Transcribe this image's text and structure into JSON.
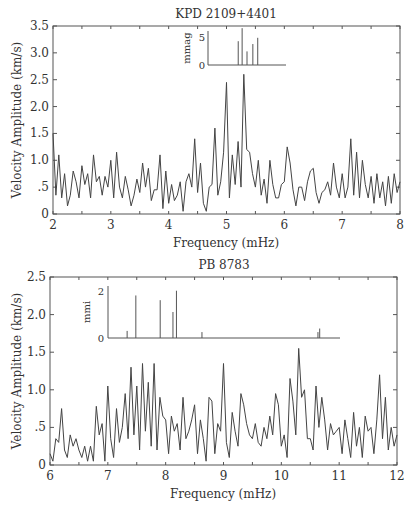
{
  "chart_data": [
    {
      "type": "line",
      "title": "KPD 2109+4401",
      "xlabel": "Frequency (mHz)",
      "ylabel": "Velocity Amplitude (km/s)",
      "xlim": [
        2,
        8
      ],
      "ylim": [
        0,
        3.5
      ],
      "x_ticks": [
        "2",
        "3",
        "4",
        "5",
        "6",
        "7",
        "8"
      ],
      "y_ticks": [
        "0",
        ".5",
        "1.0",
        "1.5",
        "2.0",
        "2.5",
        "3.0",
        "3.5"
      ],
      "grid": false,
      "x": [
        2.0,
        2.05,
        2.1,
        2.15,
        2.2,
        2.25,
        2.3,
        2.35,
        2.4,
        2.45,
        2.5,
        2.55,
        2.6,
        2.65,
        2.7,
        2.75,
        2.8,
        2.85,
        2.9,
        2.95,
        3.0,
        3.05,
        3.1,
        3.15,
        3.2,
        3.25,
        3.3,
        3.35,
        3.4,
        3.45,
        3.5,
        3.55,
        3.6,
        3.65,
        3.7,
        3.75,
        3.8,
        3.85,
        3.9,
        3.95,
        4.0,
        4.05,
        4.1,
        4.15,
        4.2,
        4.25,
        4.3,
        4.35,
        4.4,
        4.45,
        4.5,
        4.55,
        4.6,
        4.65,
        4.7,
        4.75,
        4.8,
        4.85,
        4.9,
        4.95,
        5.0,
        5.05,
        5.1,
        5.15,
        5.2,
        5.25,
        5.3,
        5.35,
        5.4,
        5.45,
        5.5,
        5.55,
        5.6,
        5.65,
        5.7,
        5.75,
        5.8,
        5.85,
        5.9,
        5.95,
        6.0,
        6.05,
        6.1,
        6.15,
        6.2,
        6.25,
        6.3,
        6.35,
        6.4,
        6.45,
        6.5,
        6.55,
        6.6,
        6.65,
        6.7,
        6.75,
        6.8,
        6.85,
        6.9,
        6.95,
        7.0,
        7.05,
        7.1,
        7.15,
        7.2,
        7.25,
        7.3,
        7.35,
        7.4,
        7.45,
        7.5,
        7.55,
        7.6,
        7.65,
        7.7,
        7.75,
        7.8,
        7.85,
        7.9,
        7.95,
        8.0
      ],
      "values": [
        1.5,
        0.35,
        1.1,
        0.3,
        0.75,
        0.15,
        0.35,
        0.8,
        0.6,
        0.3,
        0.9,
        0.55,
        0.75,
        0.3,
        1.1,
        0.6,
        0.7,
        0.35,
        0.7,
        0.5,
        1.0,
        0.3,
        1.15,
        0.5,
        0.3,
        0.7,
        0.45,
        0.15,
        0.35,
        0.65,
        0.4,
        0.95,
        0.5,
        0.85,
        0.25,
        0.45,
        0.45,
        1.1,
        0.1,
        0.8,
        0.2,
        0.55,
        0.25,
        0.35,
        0.6,
        0.05,
        0.6,
        0.75,
        0.5,
        1.4,
        0.4,
        0.95,
        0.2,
        0.05,
        0.5,
        0.55,
        1.6,
        0.35,
        0.6,
        1.15,
        2.45,
        0.3,
        1.1,
        0.55,
        1.35,
        0.5,
        2.6,
        1.2,
        1.15,
        0.75,
        0.5,
        1.0,
        0.35,
        0.65,
        0.2,
        1.0,
        0.55,
        0.3,
        0.3,
        0.55,
        0.6,
        1.25,
        0.95,
        0.45,
        0.15,
        0.5,
        0.5,
        0.25,
        0.6,
        0.8,
        0.85,
        0.4,
        0.2,
        0.4,
        0.45,
        0.6,
        0.35,
        0.95,
        0.5,
        0.3,
        0.75,
        0.3,
        0.5,
        1.4,
        0.35,
        1.15,
        0.3,
        1.0,
        0.55,
        0.3,
        0.7,
        0.2,
        0.75,
        0.3,
        0.6,
        0.15,
        0.7,
        0.2,
        0.75,
        0.4,
        0.6
      ],
      "inset": {
        "ylabel": "mmag",
        "y_ticks": [
          "0",
          "5"
        ],
        "lines_x": [
          5.02,
          5.1,
          5.2,
          5.32,
          5.42
        ],
        "lines_y": [
          4.2,
          6.5,
          2.4,
          3.7,
          4.8
        ]
      }
    },
    {
      "type": "line",
      "title": "PB 8783",
      "xlabel": "Frequency (mHz)",
      "ylabel": "Velocity Amplitude (km/s)",
      "xlim": [
        6,
        12
      ],
      "ylim": [
        0,
        2.5
      ],
      "x_ticks": [
        "6",
        "7",
        "8",
        "9",
        "10",
        "11",
        "12"
      ],
      "y_ticks": [
        "0",
        ".5",
        "1.0",
        "1.5",
        "2.0",
        "2.5"
      ],
      "grid": false,
      "x": [
        6.0,
        6.05,
        6.1,
        6.15,
        6.2,
        6.25,
        6.3,
        6.35,
        6.4,
        6.45,
        6.5,
        6.55,
        6.6,
        6.65,
        6.7,
        6.75,
        6.8,
        6.85,
        6.9,
        6.95,
        7.0,
        7.05,
        7.1,
        7.15,
        7.2,
        7.25,
        7.3,
        7.35,
        7.4,
        7.45,
        7.5,
        7.55,
        7.6,
        7.65,
        7.7,
        7.75,
        7.8,
        7.85,
        7.9,
        7.95,
        8.0,
        8.05,
        8.1,
        8.15,
        8.2,
        8.25,
        8.3,
        8.35,
        8.4,
        8.45,
        8.5,
        8.55,
        8.6,
        8.65,
        8.7,
        8.75,
        8.8,
        8.85,
        8.9,
        8.95,
        9.0,
        9.05,
        9.1,
        9.15,
        9.2,
        9.25,
        9.3,
        9.35,
        9.4,
        9.45,
        9.5,
        9.55,
        9.6,
        9.65,
        9.7,
        9.75,
        9.8,
        9.85,
        9.9,
        9.95,
        10.0,
        10.05,
        10.1,
        10.15,
        10.2,
        10.25,
        10.3,
        10.35,
        10.4,
        10.45,
        10.5,
        10.55,
        10.6,
        10.65,
        10.7,
        10.75,
        10.8,
        10.85,
        10.9,
        10.95,
        11.0,
        11.05,
        11.1,
        11.15,
        11.2,
        11.25,
        11.3,
        11.35,
        11.4,
        11.45,
        11.5,
        11.55,
        11.6,
        11.65,
        11.7,
        11.75,
        11.8,
        11.85,
        11.9,
        11.95,
        12.0
      ],
      "values": [
        0.15,
        0.05,
        0.35,
        0.3,
        0.75,
        0.2,
        0.1,
        0.4,
        0.25,
        0.35,
        0.2,
        0.1,
        0.25,
        0.05,
        0.25,
        0.05,
        0.78,
        0.4,
        0.55,
        0.05,
        1.05,
        0.35,
        0.1,
        0.75,
        0.3,
        0.5,
        0.95,
        0.35,
        1.3,
        0.4,
        1.05,
        0.2,
        1.35,
        0.45,
        1.1,
        0.25,
        1.35,
        0.2,
        0.9,
        0.65,
        0.6,
        0.15,
        0.65,
        0.45,
        0.55,
        0.2,
        0.9,
        0.35,
        0.45,
        0.6,
        0.8,
        0.15,
        0.6,
        0.35,
        0.05,
        0.9,
        0.85,
        0.15,
        0.55,
        0.45,
        1.35,
        0.3,
        0.1,
        0.7,
        0.45,
        0.25,
        0.95,
        0.8,
        0.55,
        0.4,
        0.35,
        0.55,
        0.3,
        0.25,
        0.5,
        0.35,
        0.65,
        0.4,
        0.95,
        0.8,
        0.25,
        0.4,
        0.1,
        1.15,
        0.85,
        0.4,
        1.55,
        0.9,
        1.0,
        0.35,
        0.35,
        0.2,
        1.05,
        0.5,
        0.9,
        0.6,
        0.2,
        0.55,
        0.4,
        0.45,
        0.5,
        0.15,
        0.6,
        0.35,
        0.1,
        0.7,
        0.25,
        0.5,
        0.1,
        0.65,
        0.45,
        0.5,
        0.15,
        0.6,
        1.2,
        0.35,
        0.9,
        0.2,
        0.5,
        0.25,
        0.4
      ],
      "inset": {
        "ylabel": "mmi",
        "y_ticks": [
          "0",
          "2"
        ],
        "lines_x": [
          7.33,
          7.48,
          7.9,
          8.12,
          8.18,
          8.62,
          10.62,
          10.65
        ],
        "lines_y": [
          0.3,
          1.8,
          1.6,
          1.1,
          2.0,
          0.25,
          0.25,
          0.4
        ]
      }
    }
  ]
}
